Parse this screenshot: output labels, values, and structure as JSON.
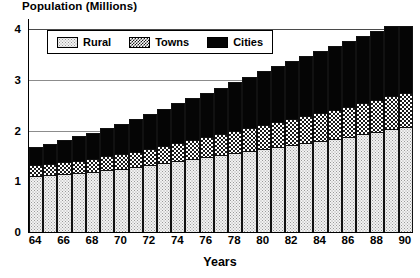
{
  "chart_data": {
    "type": "bar",
    "stacked": true,
    "title": "Population (Millions)",
    "xlabel": "Years",
    "ylabel": "",
    "ylim": [
      0,
      4.2
    ],
    "yticks": [
      0,
      1,
      2,
      3,
      4
    ],
    "grid": true,
    "legend_position": "top-left-inside",
    "categories": [
      "64",
      "65",
      "66",
      "67",
      "68",
      "69",
      "70",
      "71",
      "72",
      "73",
      "74",
      "75",
      "76",
      "77",
      "78",
      "79",
      "80",
      "81",
      "82",
      "83",
      "84",
      "85",
      "86",
      "87",
      "88",
      "89",
      "90"
    ],
    "xtick_labels": [
      "64",
      "66",
      "68",
      "70",
      "72",
      "74",
      "76",
      "78",
      "80",
      "82",
      "84",
      "86",
      "88",
      "90"
    ],
    "series": [
      {
        "name": "Rural",
        "fill": "light-stipple",
        "values": [
          1.1,
          1.12,
          1.14,
          1.16,
          1.18,
          1.22,
          1.25,
          1.28,
          1.32,
          1.36,
          1.4,
          1.44,
          1.48,
          1.52,
          1.56,
          1.6,
          1.64,
          1.68,
          1.72,
          1.76,
          1.8,
          1.84,
          1.88,
          1.93,
          1.98,
          2.03,
          2.08
        ]
      },
      {
        "name": "Towns",
        "fill": "crosshatch",
        "values": [
          0.22,
          0.23,
          0.24,
          0.25,
          0.26,
          0.27,
          0.28,
          0.29,
          0.31,
          0.33,
          0.35,
          0.37,
          0.39,
          0.41,
          0.43,
          0.45,
          0.47,
          0.49,
          0.51,
          0.53,
          0.55,
          0.57,
          0.59,
          0.61,
          0.63,
          0.65,
          0.67
        ]
      },
      {
        "name": "Cities",
        "fill": "solid-black",
        "values": [
          0.33,
          0.37,
          0.42,
          0.46,
          0.5,
          0.55,
          0.59,
          0.63,
          0.68,
          0.72,
          0.77,
          0.81,
          0.86,
          0.9,
          0.95,
          0.99,
          1.04,
          1.08,
          1.12,
          1.16,
          1.2,
          1.24,
          1.28,
          1.31,
          1.34,
          1.36,
          1.3
        ]
      }
    ],
    "totals": [
      1.65,
      1.72,
      1.8,
      1.87,
      1.94,
      2.04,
      2.12,
      2.2,
      2.31,
      2.41,
      2.52,
      2.62,
      2.73,
      2.83,
      2.94,
      3.04,
      3.15,
      3.25,
      3.35,
      3.45,
      3.55,
      3.65,
      3.75,
      3.85,
      3.95,
      4.04,
      4.05
    ]
  },
  "colors": {
    "cities": "#050505",
    "towns_ink": "#1a1a1a",
    "rural_bg": "#f2f2f2",
    "axis": "#000000",
    "grid": "#8c8c8c"
  }
}
